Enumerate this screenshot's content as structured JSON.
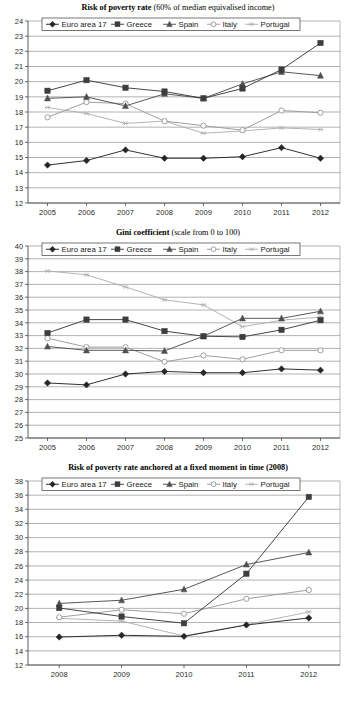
{
  "page": {
    "background": "#ffffff",
    "width": 356,
    "height": 701
  },
  "series_styles": {
    "euro": {
      "label": "Euro area 17",
      "color": "#262626",
      "marker": "diamond"
    },
    "greece": {
      "label": "Greece",
      "color": "#3d3d3d",
      "marker": "square"
    },
    "spain": {
      "label": "Spain",
      "color": "#4f4f4f",
      "marker": "triangle"
    },
    "italy": {
      "label": "Italy",
      "color": "#9a9a9a",
      "marker": "circle-open"
    },
    "portugal": {
      "label": "Portugal",
      "color": "#b0b0b0",
      "marker": "asterisk"
    }
  },
  "charts": [
    {
      "id": "risk-of-poverty-rate",
      "title_bold": "Risk of poverty rate",
      "title_regular": " (60% of median equivalised income)"
    },
    {
      "id": "gini-coefficient",
      "title_bold": "Gini coefficient",
      "title_regular": " (scale from 0 to 100)"
    },
    {
      "id": "risk-of-poverty-anchored",
      "title_bold": "Risk of poverty rate anchored at a fixed moment in time (2008)",
      "title_regular": ""
    }
  ],
  "chart_data": [
    {
      "type": "line",
      "title": "Risk of poverty rate (60% of median equivalised income)",
      "xlabel": "",
      "ylabel": "",
      "categories": [
        "2005",
        "2006",
        "2007",
        "2008",
        "2009",
        "2010",
        "2011",
        "2012"
      ],
      "ylim": [
        12,
        24
      ],
      "ytick_step": 1,
      "yticks": [
        12,
        13,
        14,
        15,
        16,
        17,
        18,
        19,
        20,
        21,
        22,
        23,
        24
      ],
      "grid": true,
      "legend_position": "top-inside",
      "series": [
        {
          "name": "Euro area 17",
          "values": [
            14.5,
            14.8,
            15.5,
            14.95,
            14.95,
            15.05,
            15.65,
            14.95
          ]
        },
        {
          "name": "Greece",
          "values": [
            19.4,
            20.1,
            19.6,
            19.35,
            18.9,
            19.55,
            20.8,
            22.55
          ]
        },
        {
          "name": "Spain",
          "values": [
            18.9,
            19.0,
            18.4,
            19.2,
            18.9,
            19.85,
            20.65,
            20.4
          ]
        },
        {
          "name": "Italy",
          "values": [
            17.65,
            18.65,
            18.55,
            17.4,
            17.1,
            16.8,
            18.1,
            17.95
          ]
        },
        {
          "name": "Portugal",
          "values": [
            18.3,
            17.9,
            17.25,
            17.4,
            16.6,
            16.75,
            16.95,
            16.85
          ]
        }
      ]
    },
    {
      "type": "line",
      "title": "Gini coefficient (scale from 0 to 100)",
      "xlabel": "",
      "ylabel": "",
      "categories": [
        "2005",
        "2006",
        "2007",
        "2008",
        "2009",
        "2010",
        "2011",
        "2012"
      ],
      "ylim": [
        25,
        40
      ],
      "ytick_step": 1,
      "yticks": [
        25,
        26,
        27,
        28,
        29,
        30,
        31,
        32,
        33,
        34,
        35,
        36,
        37,
        38,
        39,
        40
      ],
      "grid": true,
      "legend_position": "top-inside",
      "series": [
        {
          "name": "Euro area 17",
          "values": [
            29.3,
            29.15,
            30.0,
            30.2,
            30.1,
            30.1,
            30.4,
            30.3
          ]
        },
        {
          "name": "Greece",
          "values": [
            33.2,
            34.25,
            34.25,
            33.35,
            32.95,
            32.9,
            33.45,
            34.2
          ]
        },
        {
          "name": "Spain",
          "values": [
            32.15,
            31.85,
            31.85,
            31.8,
            32.95,
            34.35,
            34.35,
            34.9
          ]
        },
        {
          "name": "Italy",
          "values": [
            32.8,
            32.1,
            32.1,
            30.95,
            31.45,
            31.15,
            31.85,
            31.85
          ]
        },
        {
          "name": "Portugal",
          "values": [
            38.05,
            37.75,
            36.8,
            35.8,
            35.4,
            33.7,
            34.2,
            34.45
          ]
        }
      ]
    },
    {
      "type": "line",
      "title": "Risk of poverty rate anchored at a fixed moment in time (2008)",
      "xlabel": "",
      "ylabel": "",
      "categories": [
        "2008",
        "2009",
        "2010",
        "2011",
        "2012"
      ],
      "ylim": [
        12,
        38
      ],
      "ytick_step": 2,
      "yticks": [
        12,
        14,
        16,
        18,
        20,
        22,
        24,
        26,
        28,
        30,
        32,
        34,
        36,
        38
      ],
      "grid": true,
      "legend_position": "top-inside",
      "series": [
        {
          "name": "Euro area 17",
          "values": [
            15.95,
            16.2,
            16.05,
            17.65,
            18.65
          ]
        },
        {
          "name": "Greece",
          "values": [
            20.05,
            18.85,
            17.9,
            24.9,
            35.75
          ]
        },
        {
          "name": "Spain",
          "values": [
            20.7,
            21.15,
            22.7,
            26.2,
            27.9
          ]
        },
        {
          "name": "Italy",
          "values": [
            18.75,
            19.8,
            19.25,
            21.35,
            22.6
          ]
        },
        {
          "name": "Portugal",
          "values": [
            18.6,
            18.2,
            16.1,
            17.7,
            19.5
          ]
        }
      ]
    }
  ]
}
